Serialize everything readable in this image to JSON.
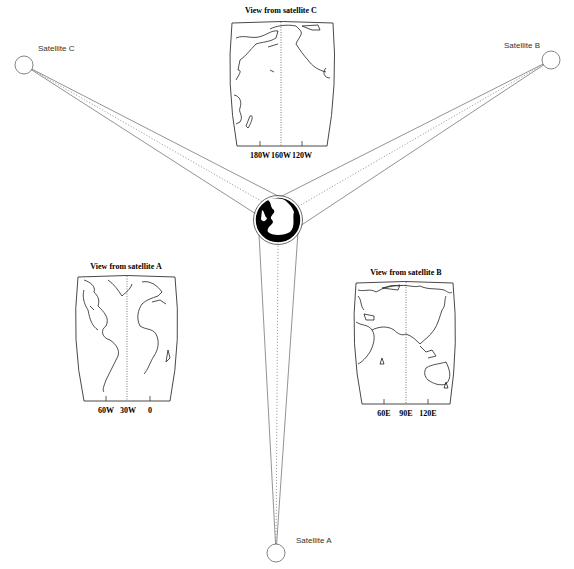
{
  "diagram": {
    "globe": {
      "name": "earth-globe",
      "cx": 278,
      "cy": 220,
      "r": 23
    },
    "satellites": [
      {
        "id": "A",
        "label": "Satellite A",
        "cx": 276,
        "cy": 553,
        "r": 9
      },
      {
        "id": "B",
        "label": "Satellite B",
        "cx": 551,
        "cy": 60,
        "r": 9
      },
      {
        "id": "C",
        "label": "Satellite C",
        "cx": 24,
        "cy": 65,
        "r": 9
      }
    ],
    "views": [
      {
        "id": "A",
        "title": "View from satellite A",
        "tick_labels": [
          "60W",
          "30W",
          "0"
        ]
      },
      {
        "id": "B",
        "title": "View from satellite B",
        "tick_labels": [
          "60E",
          "90E",
          "120E"
        ]
      },
      {
        "id": "C",
        "title": "View from satellite C",
        "tick_labels": [
          "180W",
          "160W",
          "120W"
        ]
      }
    ]
  }
}
